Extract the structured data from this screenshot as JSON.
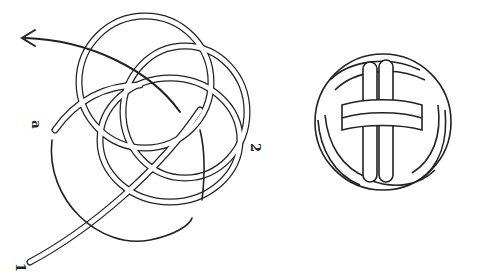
{
  "figure": {
    "left_panel": {
      "description": "Open knot weave with direction arrow",
      "labels": {
        "a": "a",
        "two": "2",
        "one": "1"
      }
    },
    "right_panel": {
      "description": "Finished Turk's head / monkey's fist ball knot"
    },
    "colors": {
      "stroke": "#222222",
      "fill": "#ffffff",
      "background": "#ffffff"
    }
  }
}
